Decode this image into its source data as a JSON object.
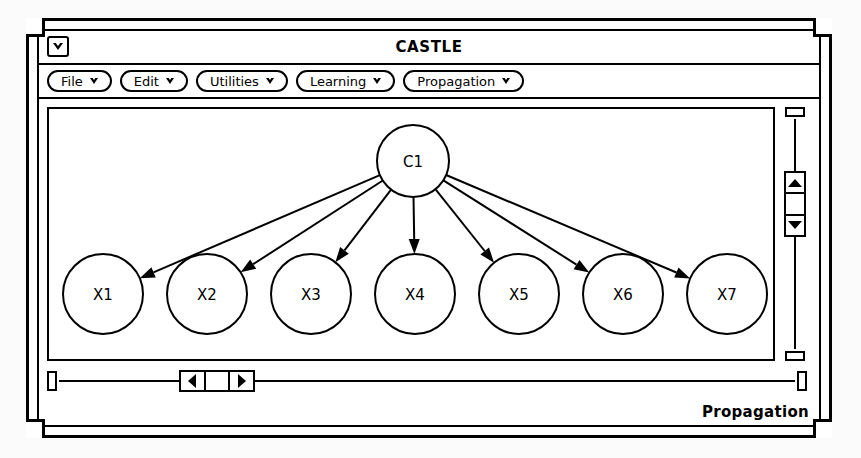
{
  "window": {
    "title": "CASTLE",
    "menu_button_icon": "triangle-down-icon"
  },
  "menubar": {
    "items": [
      {
        "label": "File",
        "icon": "chevron-down-icon"
      },
      {
        "label": "Edit",
        "icon": "chevron-down-icon"
      },
      {
        "label": "Utilities",
        "icon": "chevron-down-icon"
      },
      {
        "label": "Learning",
        "icon": "chevron-down-icon"
      },
      {
        "label": "Propagation",
        "icon": "chevron-down-icon"
      }
    ]
  },
  "graph": {
    "type": "bayesian-network",
    "description": "Naive Bayes network: root class node C1 with seven child attribute nodes X1 through X7",
    "nodes": [
      {
        "id": "C1",
        "label": "C1",
        "cx": 364,
        "cy": 52,
        "r": 36,
        "role": "root"
      },
      {
        "id": "X1",
        "label": "X1",
        "cx": 54,
        "cy": 185,
        "r": 40,
        "role": "child"
      },
      {
        "id": "X2",
        "label": "X2",
        "cx": 158,
        "cy": 185,
        "r": 40,
        "role": "child"
      },
      {
        "id": "X3",
        "label": "X3",
        "cx": 262,
        "cy": 185,
        "r": 40,
        "role": "child"
      },
      {
        "id": "X4",
        "label": "X4",
        "cx": 366,
        "cy": 185,
        "r": 40,
        "role": "child"
      },
      {
        "id": "X5",
        "label": "X5",
        "cx": 470,
        "cy": 185,
        "r": 40,
        "role": "child"
      },
      {
        "id": "X6",
        "label": "X6",
        "cx": 574,
        "cy": 185,
        "r": 40,
        "role": "child"
      },
      {
        "id": "X7",
        "label": "X7",
        "cx": 678,
        "cy": 185,
        "r": 40,
        "role": "child"
      }
    ],
    "edges": [
      {
        "from": "C1",
        "to": "X1",
        "directed": true
      },
      {
        "from": "C1",
        "to": "X2",
        "directed": true
      },
      {
        "from": "C1",
        "to": "X3",
        "directed": true
      },
      {
        "from": "C1",
        "to": "X4",
        "directed": true
      },
      {
        "from": "C1",
        "to": "X5",
        "directed": true
      },
      {
        "from": "C1",
        "to": "X6",
        "directed": true
      },
      {
        "from": "C1",
        "to": "X7",
        "directed": true
      }
    ]
  },
  "scrollbars": {
    "vertical": {
      "up_icon": "arrow-up-icon",
      "down_icon": "arrow-down-icon",
      "position_percent": 26
    },
    "horizontal": {
      "left_icon": "arrow-left-icon",
      "right_icon": "arrow-right-icon",
      "position_percent": 18
    }
  },
  "footer": {
    "status": "Propagation"
  },
  "colors": {
    "ink": "#000000",
    "paper": "#ffffff",
    "backdrop": "#fbfbfb"
  }
}
